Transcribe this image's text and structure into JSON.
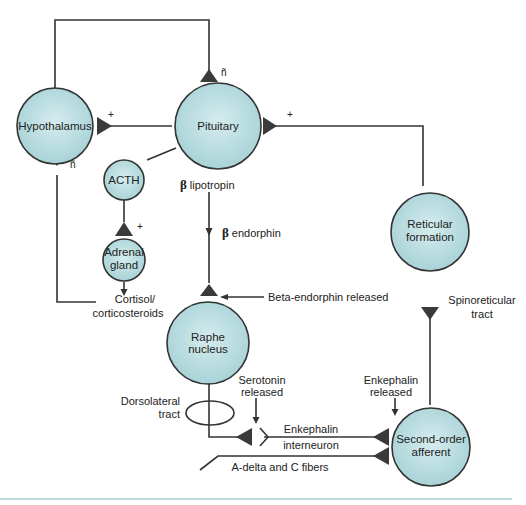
{
  "colors": {
    "node_fill": "#b9dde0",
    "node_stroke": "#333333",
    "line": "#333333",
    "synapse": "#3a3a3a",
    "rule": "#a9cfd2"
  },
  "nodes": {
    "hypothalamus": "Hypothalamus",
    "pituitary": "Pituitary",
    "acth": "ACTH",
    "adrenal_line1": "Adrenal",
    "adrenal_line2": "gland",
    "reticular_line1": "Reticular",
    "reticular_line2": "formation",
    "raphe_line1": "Raphe",
    "raphe_line2": "nucleus",
    "second_line1": "Second-order",
    "second_line2": "afferent"
  },
  "labels": {
    "beta_symbol": "β",
    "lipotropin": "lipotropin",
    "endorphin": "endorphin",
    "cortisol_line1": "Cortisol/",
    "cortisol_line2": "corticosteroids",
    "beta_endorphin_released": "Beta-endorphin released",
    "spinoreticular_line1": "Spinoreticular",
    "spinoreticular_line2": "tract",
    "dorsolateral_line1": "Dorsolateral",
    "dorsolateral_line2": "tract",
    "serotonin_line1": "Serotonin",
    "serotonin_line2": "released",
    "enkephalin_released_line1": "Enkephalin",
    "enkephalin_released_line2": "released",
    "enkephalin": "Enkephalin",
    "interneuron": "interneuron",
    "fibers": "A-delta and C fibers"
  },
  "signs": {
    "excitatory": "+",
    "inhibitory": "ñ"
  }
}
